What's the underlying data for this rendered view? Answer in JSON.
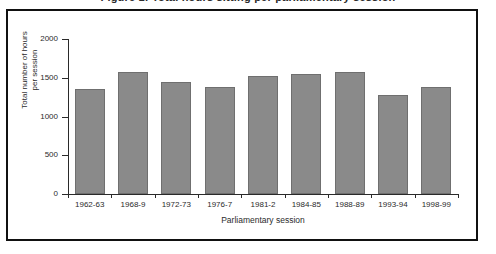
{
  "figure": {
    "clipped_title": "Figure 1: Total hours sitting per parliamentary session"
  },
  "chart_data": {
    "type": "bar",
    "title": "",
    "xlabel": "Parliamentary session",
    "ylabel": "Total number of hours per session",
    "ylabel_line1": "Total number of hours",
    "ylabel_line2": "per session",
    "categories": [
      "1962-63",
      "1968-9",
      "1972-73",
      "1976-7",
      "1981-2",
      "1984-85",
      "1988-89",
      "1993-94",
      "1998-99"
    ],
    "values": [
      1350,
      1570,
      1450,
      1375,
      1520,
      1545,
      1570,
      1275,
      1385
    ],
    "ylim": [
      0,
      2000
    ],
    "yticks": [
      0,
      500,
      1000,
      1500,
      2000
    ],
    "ytick_labels": [
      "0",
      "500",
      "1000",
      "1500",
      "2000"
    ],
    "grid": false,
    "legend": null,
    "bar_color": "#8a8a8a",
    "bar_border_color": "#6f6f6f",
    "axis_color": "#2a2a2a",
    "frame_color": "#111111",
    "background_color": "#ffffff"
  }
}
